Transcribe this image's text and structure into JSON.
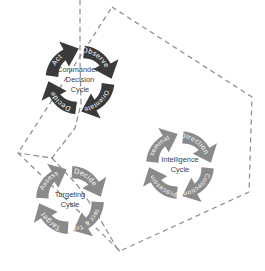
{
  "diagram": {
    "background_color": "#ffffff",
    "boundary_color": "#8d8d8d"
  },
  "cycles": [
    {
      "id": "commanders-decision-cycle",
      "name": "Commander's Decision Cycle",
      "title_lines": [
        "Commander's",
        "Decision",
        "Cycle"
      ],
      "arrow_color": "#3a3a3a",
      "label_color": "#ffffff",
      "steps": [
        {
          "label": "Observe"
        },
        {
          "label": "Orientate"
        },
        {
          "label": "Decide"
        },
        {
          "label": "Act"
        }
      ]
    },
    {
      "id": "intelligence-cycle",
      "name": "Intelligence Cycle",
      "title_lines": [
        "Intelligence",
        "Cycle"
      ],
      "arrow_color": "#8a8a8a",
      "label_color": "#ffffff",
      "steps": [
        {
          "label": "Direction"
        },
        {
          "label": "Collection"
        },
        {
          "label": "Processing"
        },
        {
          "label": "Dissemination"
        }
      ]
    },
    {
      "id": "targeting-cycle",
      "name": "Targeting Cycle",
      "title_lines": [
        "Targeting",
        "Cycle"
      ],
      "arrow_color": "#8a8a8a",
      "label_color": "#ffffff",
      "steps": [
        {
          "label": "Decide"
        },
        {
          "label": "Detect & Track"
        },
        {
          "label": "Target"
        },
        {
          "label": "Assess"
        }
      ]
    }
  ]
}
